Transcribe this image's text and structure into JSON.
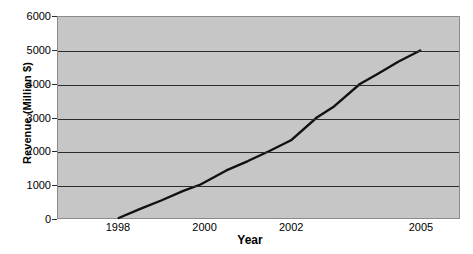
{
  "chart_data": {
    "type": "line",
    "title": "",
    "xlabel": "Year",
    "ylabel": "Revenue (Million $)",
    "xlim": [
      1997.0,
      1005.5
    ],
    "ylim": [
      0,
      6000
    ],
    "grid": true,
    "legend": null,
    "x_ticks": [
      1998,
      2000,
      2002,
      2005
    ],
    "x_tick_labels": [
      "1998",
      "2000",
      "2002",
      "2005"
    ],
    "y_ticks": [
      0,
      1000,
      2000,
      3000,
      4000,
      5000,
      6000
    ],
    "y_tick_labels": [
      "0",
      "1000",
      "2000",
      "3000",
      "4000",
      "5000",
      "6000"
    ],
    "series": [
      {
        "name": "Revenue",
        "color": "#111111",
        "x": [
          1998.0,
          1998.5,
          1999.0,
          1999.5,
          1999.9,
          2000.5,
          2001.0,
          2001.5,
          2002.0,
          2002.6,
          2003.0,
          2003.6,
          2004.0,
          2004.5,
          2005.0
        ],
        "y": [
          0,
          270,
          530,
          810,
          1000,
          1420,
          1700,
          2000,
          2320,
          3000,
          3330,
          4000,
          4290,
          4670,
          5000
        ]
      }
    ],
    "plot_background": "#c6c6c6",
    "page_background": "#ffffff",
    "gridline_color": "#2b2b2b"
  },
  "axes": {
    "x_title": "Year",
    "y_title": "Revenue (Million $)"
  }
}
